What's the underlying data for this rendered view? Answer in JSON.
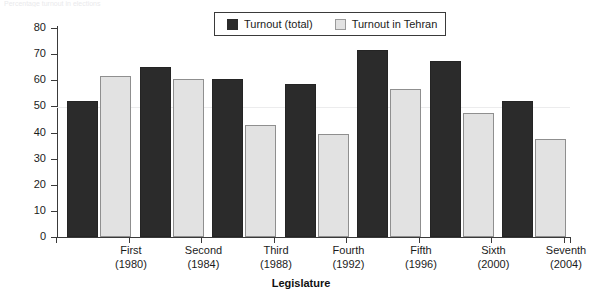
{
  "top_sliver_text": "Percentage turnout in elections",
  "legend": {
    "position": "top-center",
    "entries": [
      {
        "label": "Turnout (total)",
        "swatch": "dark-square-swatch",
        "color": "#2b2b2b"
      },
      {
        "label": "Turnout in Tehran",
        "swatch": "light-square-swatch",
        "color": "#e2e2e2"
      }
    ]
  },
  "chart_data": {
    "type": "bar",
    "title": "",
    "xlabel": "Legislature",
    "ylabel": "Percentage",
    "ylim": [
      0,
      80
    ],
    "yticks": [
      0,
      10,
      20,
      30,
      40,
      50,
      60,
      70,
      80
    ],
    "grid": false,
    "categories": [
      "First\n(1980)",
      "Second\n(1984)",
      "Third\n(1988)",
      "Fourth\n(1992)",
      "Fifth\n(1996)",
      "Sixth\n(2000)",
      "Seventh\n(2004)"
    ],
    "category_names": [
      "First",
      "Second",
      "Third",
      "Fourth",
      "Fifth",
      "Sixth",
      "Seventh"
    ],
    "category_years": [
      "(1980)",
      "(1984)",
      "(1988)",
      "(1992)",
      "(1996)",
      "(2000)",
      "(2004)"
    ],
    "series": [
      {
        "name": "Turnout (total)",
        "color": "#2b2b2b",
        "values": [
          52,
          65,
          60.5,
          58.5,
          71.5,
          67.5,
          52
        ]
      },
      {
        "name": "Turnout in Tehran",
        "color": "#e2e2e2",
        "values": [
          61.5,
          60.5,
          43,
          39.5,
          56.5,
          47.5,
          37.5
        ]
      }
    ]
  }
}
